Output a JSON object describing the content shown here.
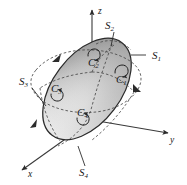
{
  "figure": {
    "type": "3d-geometry-diagram",
    "background_color": "#ffffff",
    "outline_color": "#2b2b2b",
    "dashed_color": "#4a4a4a",
    "surface_fill_light": "#fbfbfb",
    "surface_fill_mid": "#dedede",
    "surface_fill_dark": "#9a9a9a"
  },
  "axes": [
    {
      "id": "x",
      "label": "x",
      "label_x": 30,
      "label_y": 174,
      "direction": "down-left",
      "arrowhead": true
    },
    {
      "id": "y",
      "label": "y",
      "label_x": 172,
      "label_y": 140,
      "direction": "right-down",
      "arrowhead": true
    },
    {
      "id": "z",
      "label": "z",
      "label_x": 98,
      "label_y": 12,
      "direction": "up",
      "arrowhead": true
    }
  ],
  "surface_labels": [
    {
      "id": "S1",
      "base": "S",
      "sub": "1",
      "x": 163,
      "y": 58,
      "leader": "horizontal-left",
      "patch": "right-front"
    },
    {
      "id": "S2",
      "base": "S",
      "sub": "2",
      "x": 113,
      "y": 27,
      "leader": "down",
      "patch": "top-back"
    },
    {
      "id": "S3",
      "base": "S",
      "sub": "3",
      "x": 25,
      "y": 83,
      "leader": "down-right",
      "patch": "left-front"
    },
    {
      "id": "S4",
      "base": "S",
      "sub": "4",
      "x": 86,
      "y": 172,
      "leader": "up",
      "patch": "bottom-front"
    }
  ],
  "curve_labels": [
    {
      "id": "C1",
      "base": "C",
      "sub": "1",
      "x": 121,
      "y": 80,
      "loop": "above",
      "orientation": "counterclockwise"
    },
    {
      "id": "C2",
      "base": "C",
      "sub": "2",
      "x": 93,
      "y": 63,
      "loop": "above",
      "orientation": "counterclockwise"
    },
    {
      "id": "C3",
      "base": "C",
      "sub": "3",
      "x": 56,
      "y": 89,
      "loop": "below",
      "orientation": "counterclockwise"
    },
    {
      "id": "C4",
      "base": "C",
      "sub": "4",
      "x": 82,
      "y": 113,
      "loop": "below",
      "orientation": "counterclockwise"
    }
  ],
  "boundary_arrows": [
    {
      "id": "arrow-upper-left",
      "x": 55,
      "y": 58,
      "direction": "up-right"
    },
    {
      "id": "arrow-right",
      "x": 137,
      "y": 89,
      "direction": "down-right"
    },
    {
      "id": "arrow-lower-left",
      "x": 33,
      "y": 123,
      "direction": "down-left"
    }
  ]
}
